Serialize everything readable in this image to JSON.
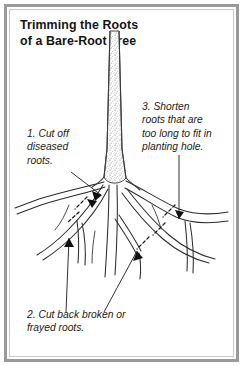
{
  "figure": {
    "title_lines": [
      "Trimming the Roots",
      "of a Bare-Root Tree"
    ],
    "title_full": "Trimming the Roots of a Bare-Root Tree",
    "frame_color": "#9a9a9a",
    "background_color": "#ffffff",
    "ink_color": "#1b1b1b"
  },
  "callouts": [
    {
      "id": "callout-1",
      "number": "1.",
      "lines": [
        "1. Cut off",
        "diseased",
        "roots."
      ],
      "text": "1. Cut off diseased roots.",
      "leader": "diagonal line to arrowheads at upper-left roots"
    },
    {
      "id": "callout-2",
      "number": "2.",
      "lines": [
        "2. Cut back broken or",
        "frayed roots."
      ],
      "text": "2. Cut back broken or frayed roots.",
      "leader": "two lines rising to arrowheads on lower roots"
    },
    {
      "id": "callout-3",
      "number": "3.",
      "lines": [
        "3. Shorten",
        "roots that are",
        "too long to fit in",
        "planting hole."
      ],
      "text": "3. Shorten roots that are too long to fit in planting hole.",
      "leader": "vertical line down to arrowhead on right-hand root"
    }
  ],
  "illustration": {
    "subject": "bare-root tree with trunk and spreading root system",
    "parts": [
      {
        "name": "trunk",
        "description": "stippled vertical trunk widening at base"
      },
      {
        "name": "root-flare",
        "description": "root crown where roots join trunk"
      },
      {
        "name": "taproot",
        "description": "central descending root"
      },
      {
        "name": "lateral-roots",
        "description": "spreading lateral roots, left and right"
      },
      {
        "name": "cut-marks",
        "description": "short dashed slashes marking where to cut roots"
      },
      {
        "name": "arrowheads",
        "description": "solid arrowheads at ends of callout leader lines"
      }
    ]
  }
}
